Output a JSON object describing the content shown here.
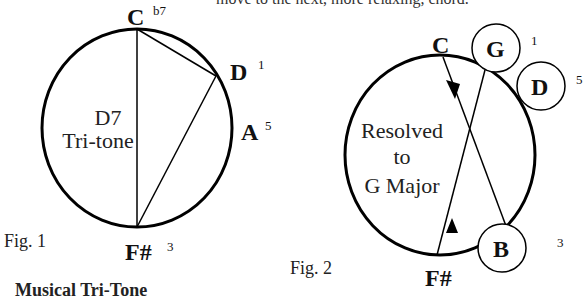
{
  "header": {
    "partial_text": "move to the next, more relaxing, chord."
  },
  "footer": {
    "partial_text": "Musical Tri-Tone"
  },
  "figure1": {
    "caption": "Fig. 1",
    "center_label_line1": "D7",
    "center_label_line2": "Tri-tone",
    "notes": [
      {
        "name": "C",
        "degree": "b7"
      },
      {
        "name": "D",
        "degree": "1"
      },
      {
        "name": "A",
        "degree": "5"
      },
      {
        "name": "F#",
        "degree": "3"
      }
    ]
  },
  "figure2": {
    "caption": "Fig. 2",
    "center_label_line1": "Resolved",
    "center_label_line2": "to",
    "center_label_line3": "G Major",
    "notes": [
      {
        "name": "C",
        "degree": ""
      },
      {
        "name": "G",
        "degree": "1",
        "circled": true
      },
      {
        "name": "D",
        "degree": "5",
        "circled": true
      },
      {
        "name": "B",
        "degree": "3",
        "circled": true
      },
      {
        "name": "F#",
        "degree": ""
      }
    ]
  },
  "colors": {
    "stroke": "#000000",
    "text": "#111111",
    "background": "#ffffff"
  }
}
